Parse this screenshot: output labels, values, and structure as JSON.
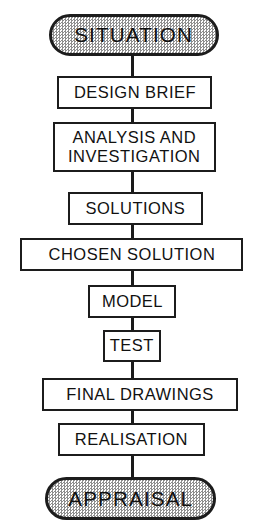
{
  "diagram": {
    "orientation": "vertical-top-to-bottom",
    "colors": {
      "outline": "#1c1c1c",
      "connector": "#1a1a1a",
      "capsule_fill": "#d9d9d9",
      "box_fill": "#ffffff",
      "text": "#111111"
    },
    "nodes": [
      {
        "id": "situation",
        "label": "SITUATION",
        "shape": "capsule-stippled",
        "role": "start-terminal",
        "x": 49,
        "y": 14,
        "w": 170,
        "h": 42
      },
      {
        "id": "design-brief",
        "label": "DESIGN  BRIEF",
        "shape": "rectangle",
        "role": "process",
        "x": 57,
        "y": 76,
        "w": 155,
        "h": 33
      },
      {
        "id": "analysis-and-investigation",
        "label": "ANALYSIS AND\nINVESTIGATION",
        "shape": "rectangle",
        "role": "process",
        "x": 53,
        "y": 122,
        "w": 163,
        "h": 50
      },
      {
        "id": "solutions",
        "label": "SOLUTIONS",
        "shape": "rectangle",
        "role": "process",
        "x": 68,
        "y": 192,
        "w": 135,
        "h": 33
      },
      {
        "id": "chosen-solution",
        "label": "CHOSEN  SOLUTION",
        "shape": "rectangle",
        "role": "process",
        "x": 20,
        "y": 238,
        "w": 223,
        "h": 33
      },
      {
        "id": "model",
        "label": "MODEL",
        "shape": "rectangle",
        "role": "process",
        "x": 88,
        "y": 285,
        "w": 88,
        "h": 33
      },
      {
        "id": "test",
        "label": "TEST",
        "shape": "rectangle",
        "role": "process",
        "x": 103,
        "y": 330,
        "w": 58,
        "h": 32
      },
      {
        "id": "final-drawings",
        "label": "FINAL  DRAWINGS",
        "shape": "rectangle",
        "role": "process",
        "x": 42,
        "y": 378,
        "w": 196,
        "h": 33
      },
      {
        "id": "realisation",
        "label": "REALISATION",
        "shape": "rectangle",
        "role": "process",
        "x": 58,
        "y": 423,
        "w": 147,
        "h": 33
      },
      {
        "id": "appraisal",
        "label": "APPRAISAL",
        "shape": "capsule-stippled",
        "role": "end-terminal",
        "x": 45,
        "y": 477,
        "w": 171,
        "h": 43
      }
    ],
    "connectors": [
      {
        "id": "situation-to-design-brief",
        "from": "situation",
        "to": "design-brief",
        "y": 54,
        "h": 24
      },
      {
        "id": "design-brief-to-analysis",
        "from": "design-brief",
        "to": "analysis-and-investigation",
        "y": 107,
        "h": 17
      },
      {
        "id": "analysis-to-solutions",
        "from": "analysis-and-investigation",
        "to": "solutions",
        "y": 170,
        "h": 24
      },
      {
        "id": "solutions-to-chosen-solution",
        "from": "solutions",
        "to": "chosen-solution",
        "y": 223,
        "h": 17
      },
      {
        "id": "chosen-solution-to-model",
        "from": "chosen-solution",
        "to": "model",
        "y": 269,
        "h": 18
      },
      {
        "id": "model-to-test",
        "from": "model",
        "to": "test",
        "y": 316,
        "h": 16
      },
      {
        "id": "test-to-final-drawings",
        "from": "test",
        "to": "final-drawings",
        "y": 360,
        "h": 20
      },
      {
        "id": "final-drawings-to-realisation",
        "from": "final-drawings",
        "to": "realisation",
        "y": 409,
        "h": 16
      },
      {
        "id": "realisation-to-appraisal",
        "from": "realisation",
        "to": "appraisal",
        "y": 454,
        "h": 25
      }
    ]
  }
}
